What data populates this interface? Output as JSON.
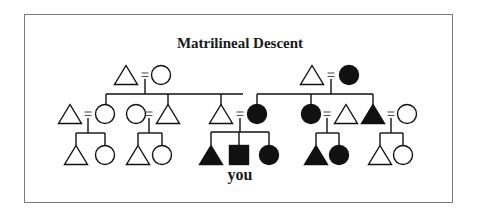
{
  "diagram": {
    "title": "Matrilineal Descent",
    "ego_label": "you",
    "colors": {
      "line": "#111111",
      "filled": "#111111",
      "empty": "#ffffff",
      "border": "#7a7a7a"
    },
    "legend_semantics": {
      "triangle": "male",
      "circle": "female",
      "square": "ego",
      "filled": "member of ego's matrilineage",
      "equals": "marriage"
    },
    "nodes": [
      {
        "id": "g1-left-husband",
        "shape": "triangle",
        "filled": false,
        "x": 126,
        "y": 75
      },
      {
        "id": "g1-left-wife",
        "shape": "circle",
        "filled": false,
        "x": 161,
        "y": 75
      },
      {
        "id": "g1-right-husband",
        "shape": "triangle",
        "filled": false,
        "x": 312,
        "y": 75
      },
      {
        "id": "g1-right-wife",
        "shape": "circle",
        "filled": true,
        "x": 349,
        "y": 75
      },
      {
        "id": "g2-a-husband",
        "shape": "triangle",
        "filled": false,
        "x": 70,
        "y": 114
      },
      {
        "id": "g2-a-wife",
        "shape": "circle",
        "filled": false,
        "x": 105,
        "y": 114
      },
      {
        "id": "g2-b-wife",
        "shape": "circle",
        "filled": false,
        "x": 136,
        "y": 114
      },
      {
        "id": "g2-b-husband",
        "shape": "triangle",
        "filled": false,
        "x": 168,
        "y": 114
      },
      {
        "id": "g2-father",
        "shape": "triangle",
        "filled": false,
        "x": 221,
        "y": 114
      },
      {
        "id": "g2-mother",
        "shape": "circle",
        "filled": true,
        "x": 257,
        "y": 114
      },
      {
        "id": "g2-aunt",
        "shape": "circle",
        "filled": true,
        "x": 311,
        "y": 114
      },
      {
        "id": "g2-aunt-husband",
        "shape": "triangle",
        "filled": false,
        "x": 346,
        "y": 114
      },
      {
        "id": "g2-uncle",
        "shape": "triangle",
        "filled": true,
        "x": 373,
        "y": 114
      },
      {
        "id": "g2-uncle-wife",
        "shape": "circle",
        "filled": false,
        "x": 407,
        "y": 114
      },
      {
        "id": "g3-a-son",
        "shape": "triangle",
        "filled": false,
        "x": 76,
        "y": 155
      },
      {
        "id": "g3-a-daughter",
        "shape": "circle",
        "filled": false,
        "x": 105,
        "y": 155
      },
      {
        "id": "g3-b-son",
        "shape": "triangle",
        "filled": false,
        "x": 138,
        "y": 155
      },
      {
        "id": "g3-b-daughter",
        "shape": "circle",
        "filled": false,
        "x": 162,
        "y": 155
      },
      {
        "id": "g3-brother",
        "shape": "triangle",
        "filled": true,
        "x": 211,
        "y": 155
      },
      {
        "id": "g3-ego",
        "shape": "square",
        "filled": true,
        "x": 239,
        "y": 155
      },
      {
        "id": "g3-sister",
        "shape": "circle",
        "filled": true,
        "x": 269,
        "y": 155
      },
      {
        "id": "g3-c-son",
        "shape": "triangle",
        "filled": true,
        "x": 316,
        "y": 155
      },
      {
        "id": "g3-c-daughter",
        "shape": "circle",
        "filled": true,
        "x": 339,
        "y": 155
      },
      {
        "id": "g3-d-son",
        "shape": "triangle",
        "filled": false,
        "x": 380,
        "y": 155
      },
      {
        "id": "g3-d-daughter",
        "shape": "circle",
        "filled": false,
        "x": 403,
        "y": 155
      }
    ],
    "marriages": [
      {
        "x": 145,
        "y": 75,
        "drop_to": 94
      },
      {
        "x": 331,
        "y": 75,
        "drop_to": 94
      },
      {
        "x": 88,
        "y": 114,
        "drop_to": 133
      },
      {
        "x": 149,
        "y": 114,
        "drop_to": 133
      },
      {
        "x": 240,
        "y": 114,
        "drop_to": 132
      },
      {
        "x": 327,
        "y": 114,
        "drop_to": 133
      },
      {
        "x": 391,
        "y": 114,
        "drop_to": 133
      }
    ],
    "sibling_bars": [
      {
        "y": 94,
        "x1": 106,
        "x2": 243,
        "drops": [
          106,
          168,
          221
        ]
      },
      {
        "y": 94,
        "x1": 257,
        "x2": 373,
        "drops": [
          257,
          311,
          373
        ]
      },
      {
        "y": 133,
        "x1": 76,
        "x2": 105,
        "drops": [
          76,
          105
        ]
      },
      {
        "y": 133,
        "x1": 138,
        "x2": 162,
        "drops": [
          138,
          162
        ]
      },
      {
        "y": 132,
        "x1": 211,
        "x2": 269,
        "drops": [
          211,
          239,
          269
        ]
      },
      {
        "y": 133,
        "x1": 316,
        "x2": 339,
        "drops": [
          316,
          339
        ]
      },
      {
        "y": 133,
        "x1": 380,
        "x2": 403,
        "drops": [
          380,
          403
        ]
      }
    ]
  }
}
